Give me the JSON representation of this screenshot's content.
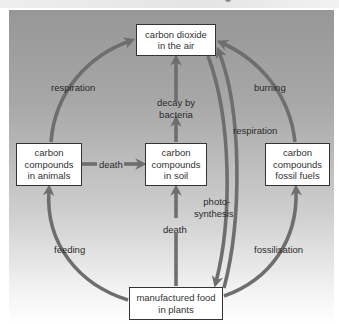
{
  "diagram": {
    "colors": {
      "arrow": "#6e6e6e",
      "panel_top": "#979797",
      "panel_bottom": "#ffffff",
      "box_fill": "#ffffff",
      "box_border": "#333333"
    },
    "nodes": {
      "co2": {
        "line1": "carbon dioxide",
        "line2": "in the air"
      },
      "animals": {
        "line1": "carbon",
        "line2": "compounds",
        "line3": "in animals"
      },
      "soil": {
        "line1": "carbon",
        "line2": "compounds",
        "line3": "in soil"
      },
      "fossil": {
        "line1": "carbon",
        "line2": "compounds",
        "line3": "fossil fuels"
      },
      "plants": {
        "line1": "manufactured food",
        "line2": "in plants"
      }
    },
    "edges": {
      "respiration_animals": {
        "label": "respiration",
        "from": "animals",
        "to": "co2"
      },
      "decay": {
        "line1": "decay by",
        "line2": "bacteria",
        "from": "soil",
        "to": "co2"
      },
      "burning": {
        "label": "burning",
        "from": "fossil",
        "to": "co2"
      },
      "death_animals": {
        "label": "death",
        "from": "animals",
        "to": "soil"
      },
      "respiration_plants": {
        "label": "respiration",
        "from": "plants",
        "to": "co2"
      },
      "photosynthesis": {
        "line1": "photo-",
        "line2": "synthesis",
        "from": "co2",
        "to": "plants"
      },
      "feeding": {
        "label": "feeding",
        "from": "plants",
        "to": "animals"
      },
      "death_plants": {
        "label": "death",
        "from": "plants",
        "to": "soil"
      },
      "fossilisation": {
        "label": "fossilisation",
        "from": "plants",
        "to": "fossil"
      }
    }
  }
}
